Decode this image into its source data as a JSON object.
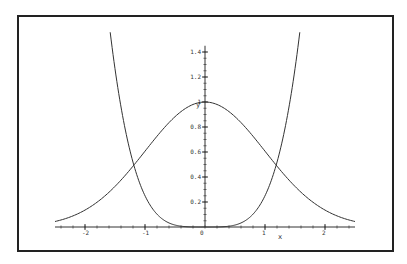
{
  "chart_data": {
    "type": "line",
    "title": "",
    "xlabel": "x",
    "ylabel": "y",
    "xlim": [
      -2.5,
      2.5
    ],
    "ylim": [
      0,
      1.45
    ],
    "grid": false,
    "legend": null,
    "x_ticks": [
      -2,
      -1,
      0,
      1,
      2
    ],
    "x_tick_labels": [
      "-2",
      "-1",
      "0",
      "1",
      "2"
    ],
    "y_ticks": [
      0.2,
      0.4,
      0.6,
      0.8,
      1,
      1.2,
      1.4
    ],
    "y_tick_labels": [
      "0.2",
      "0.4",
      "0.6",
      "0.8",
      "1",
      "1.2",
      "1.4"
    ],
    "origin_label": "0",
    "series": [
      {
        "name": "exp(-x^2/2)",
        "x": [
          -2.5,
          -2.0,
          -1.5,
          -1.0,
          -0.5,
          0,
          0.5,
          1.0,
          1.5,
          2.0,
          2.5
        ],
        "values": [
          0.044,
          0.135,
          0.325,
          0.607,
          0.882,
          1.0,
          0.882,
          0.607,
          0.325,
          0.135,
          0.044
        ]
      },
      {
        "name": "x^4/4",
        "x": [
          -1.58,
          -1.5,
          -1.25,
          -1.0,
          -0.75,
          -0.5,
          0,
          0.5,
          0.75,
          1.0,
          1.25,
          1.5,
          1.58
        ],
        "values": [
          1.56,
          1.27,
          0.61,
          0.25,
          0.08,
          0.016,
          0,
          0.016,
          0.08,
          0.25,
          0.61,
          1.27,
          1.56
        ]
      }
    ]
  }
}
